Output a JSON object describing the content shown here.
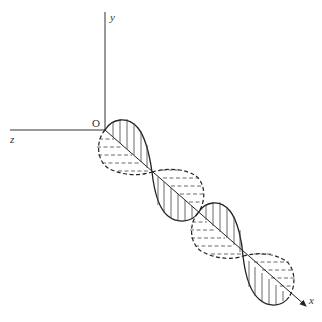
{
  "diagram": {
    "type": "electromagnetic-wave-3d",
    "axes": {
      "x_label": "x",
      "y_label": "y",
      "z_label": "z",
      "origin_label": "O"
    },
    "colors": {
      "stroke": "#222222",
      "background": "#ffffff"
    },
    "wave": {
      "solid_field": "E (in x-y plane, solid outline with vertical hatching)",
      "dashed_field": "B (in x-z plane, dashed outline with horizontal dashed hatching)",
      "half_cycles": 4
    }
  }
}
